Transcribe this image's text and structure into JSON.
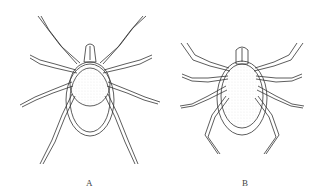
{
  "figure": {
    "panels": [
      {
        "label": "A",
        "subject": "tick-illustration-female"
      },
      {
        "label": "B",
        "subject": "tick-illustration-male"
      }
    ],
    "colors": {
      "line": "#333333",
      "stipple": "#bbbbbb",
      "background": "#ffffff"
    }
  }
}
